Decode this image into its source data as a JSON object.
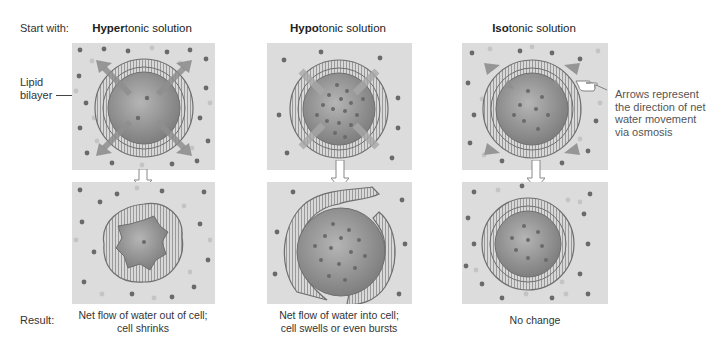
{
  "labels": {
    "start_with": "Start with:",
    "result": "Result:",
    "lipid_bilayer_line1": "Lipid",
    "lipid_bilayer_line2": "bilayer"
  },
  "columns": [
    {
      "title_bold": "Hyper",
      "title_rest": "tonic solution",
      "result_line1": "Net flow of water out of cell;",
      "result_line2": "cell shrinks",
      "arrow_direction": "outward"
    },
    {
      "title_bold": "Hypo",
      "title_rest": "tonic solution",
      "result_line1": "Net flow of water into cell;",
      "result_line2": "cell swells or even bursts",
      "arrow_direction": "inward"
    },
    {
      "title_bold": "Iso",
      "title_rest": "tonic solution",
      "result_line1": "No change",
      "result_line2": "",
      "arrow_direction": "both"
    }
  ],
  "annotation": {
    "line1": "Arrows represent",
    "line2": "the direction of net",
    "line3": "water movement",
    "line4": "via osmosis",
    "icon": "pointing-hand-icon"
  },
  "colors": {
    "panel_bg": "#dcdcdc",
    "cell_fill": "#9a9a9a",
    "membrane": "#777777",
    "arrow": "#8f8f8f",
    "solute_dark": "#6a6a6a",
    "solute_light": "#c4c4c4"
  }
}
